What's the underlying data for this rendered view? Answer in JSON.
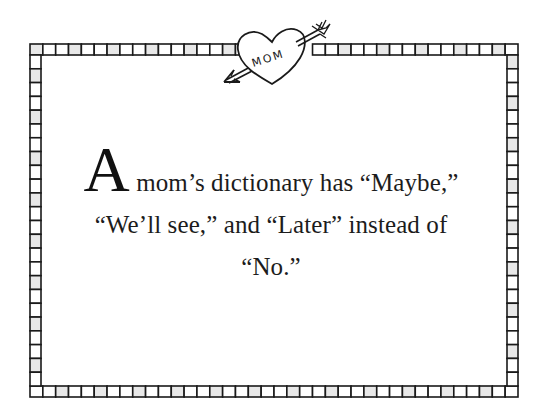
{
  "page": {
    "heart_label": "MOM",
    "quote": {
      "drop_cap": "A",
      "line1_rest": " mom’s dictionary has “Maybe,”",
      "line2": "“We’ll see,” and “Later” instead of",
      "line3": "“No.”"
    },
    "colors": {
      "ink": "#1a1a1a",
      "cell_fill": "#e8e8e8",
      "background": "#ffffff"
    },
    "icons": [
      "heart-with-arrow-icon",
      "checkered-border-frame"
    ]
  }
}
